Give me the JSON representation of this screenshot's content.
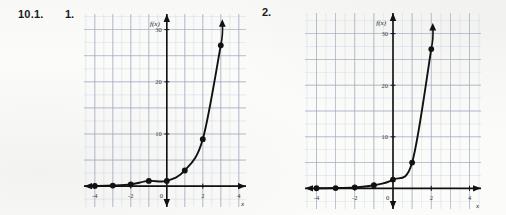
{
  "page": {
    "exercise_number": "10.1.",
    "background_color": "#fbfbfa",
    "ink_color": "#1b1b1b"
  },
  "items": [
    {
      "label": "1."
    },
    {
      "label": "2."
    }
  ],
  "chart_data": [
    {
      "type": "line",
      "item_label": "1.",
      "title": "",
      "subtitle": "",
      "xlabel": "x",
      "ylabel": "f(x)",
      "axis_label_y_text": "f(x)",
      "axis_label_x_text": "x",
      "xlim": [
        -4.6,
        4.4
      ],
      "ylim": [
        -4,
        33
      ],
      "xticks": [
        -4,
        -2,
        0,
        2,
        4
      ],
      "xtick_labels": [
        "-4",
        "-2",
        "0",
        "2",
        "4"
      ],
      "yticks": [
        10,
        20,
        30
      ],
      "ytick_labels": [
        "10",
        "20",
        "30"
      ],
      "grid": true,
      "grid_minor_step_x": 0.5,
      "grid_minor_step_y": 2.5,
      "grid_major_step_x": 1,
      "grid_major_step_y": 5,
      "grid_color": "#c7cfdd",
      "grid_major_color": "#9aa6ba",
      "curve_color": "#111111",
      "arrow_at_end": true,
      "points": [
        {
          "x": -4,
          "y": 0.04
        },
        {
          "x": -3,
          "y": 0.11
        },
        {
          "x": -2,
          "y": 0.33
        },
        {
          "x": -1,
          "y": 1
        },
        {
          "x": 0,
          "y": 1
        },
        {
          "x": 1,
          "y": 3
        },
        {
          "x": 2,
          "y": 9
        },
        {
          "x": 3,
          "y": 27
        }
      ],
      "point_labels": [
        "(-4, 0)",
        "(-3, 0)",
        "(-2, 0)",
        "(-1, 1)",
        "(0, 1)",
        "(1, 3)",
        "(2, 9)",
        "(3, 27)"
      ],
      "legend": [],
      "legend_position": "none",
      "annotations": []
    },
    {
      "type": "line",
      "item_label": "2.",
      "title": "",
      "subtitle": "",
      "xlabel": "x",
      "ylabel": "f(x)",
      "axis_label_y_text": "f(x)",
      "axis_label_x_text": "x",
      "xlim": [
        -4.6,
        4.6
      ],
      "ylim": [
        -4,
        34
      ],
      "xticks": [
        -4,
        -2,
        0,
        2,
        4
      ],
      "xtick_labels": [
        "-4",
        "-2",
        "0",
        "2",
        "4"
      ],
      "yticks": [
        10,
        20,
        30
      ],
      "ytick_labels": [
        "10",
        "20",
        "30"
      ],
      "grid": true,
      "grid_minor_step_x": 0.5,
      "grid_minor_step_y": 2.5,
      "grid_major_step_x": 1,
      "grid_major_step_y": 5,
      "grid_color": "#c7cfdd",
      "grid_major_color": "#9aa6ba",
      "curve_color": "#111111",
      "arrow_at_end": true,
      "points": [
        {
          "x": -4,
          "y": 0.02
        },
        {
          "x": -3,
          "y": 0.06
        },
        {
          "x": -2,
          "y": 0.2
        },
        {
          "x": -1,
          "y": 0.6
        },
        {
          "x": 0,
          "y": 1.7
        },
        {
          "x": 1,
          "y": 5
        },
        {
          "x": 2,
          "y": 27
        }
      ],
      "point_labels": [
        "(-4, 0)",
        "(-3, 0)",
        "(-2, 0)",
        "(-1, 0)",
        "(0, 2)",
        "(1, 5)",
        "(2, 27)"
      ],
      "legend": [],
      "legend_position": "none",
      "annotations": []
    }
  ]
}
